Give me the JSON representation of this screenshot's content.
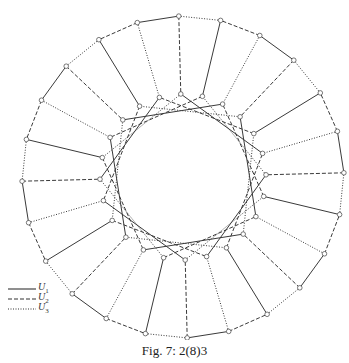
{
  "figure": {
    "caption": "Fig. 7: 2(8)3",
    "graph": {
      "type": "generalized-petersen",
      "n": 24,
      "k": 5,
      "center": [
        183,
        177
      ],
      "outer_radius": 161,
      "inner_radius": 83,
      "start_angle_deg": -91.5,
      "edge_color": "#3a3a3a",
      "vertex_radius": 2.3
    },
    "legend": [
      {
        "style": "solid",
        "label": "U",
        "sub": "1"
      },
      {
        "style": "dashed",
        "label": "U",
        "sub": "2"
      },
      {
        "style": "dotted",
        "label": "U",
        "sub": "3"
      }
    ]
  }
}
